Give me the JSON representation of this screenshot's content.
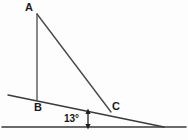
{
  "figure": {
    "kind": "geometry-diagram",
    "background_color": "#fdfdfd",
    "stroke_color": "#333333",
    "text_color": "#1a1a1a",
    "labels": {
      "apex": "A",
      "base_left": "B",
      "base_right": "C",
      "incline_angle": "13°"
    },
    "lines": {
      "ground_line": {
        "name": "horizontal-ground-line",
        "x1": 2,
        "y1": 127,
        "x2": 186,
        "y2": 127
      },
      "incline_line": {
        "name": "inclined-slope-line",
        "x1": 8,
        "y1": 95,
        "x2": 164,
        "y2": 127
      },
      "side_ab": {
        "name": "vertical-side-ab",
        "x1": 37,
        "y1": 14,
        "x2": 37,
        "y2": 100
      },
      "side_ac": {
        "name": "hypotenuse-side-ac",
        "x1": 37,
        "y1": 14,
        "x2": 111,
        "y2": 112
      }
    },
    "gap_arrow": {
      "name": "vertical-gap-arrow",
      "x": 88,
      "y_top": 111,
      "y_bottom": 127
    },
    "points": {
      "A": {
        "x": 37,
        "y": 14
      },
      "B": {
        "x": 37,
        "y": 100
      },
      "C": {
        "x": 111,
        "y": 112
      }
    }
  }
}
